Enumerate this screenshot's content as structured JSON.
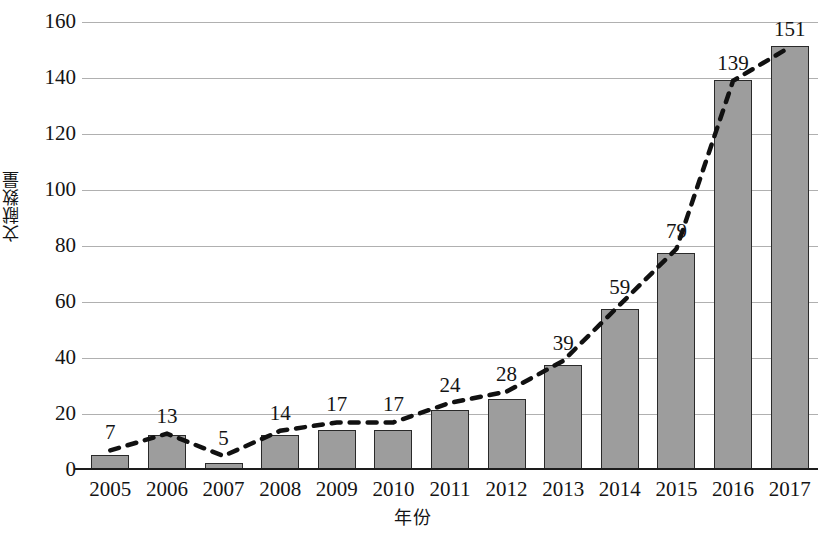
{
  "chart_data": {
    "type": "bar",
    "title": "",
    "xlabel": "年份",
    "ylabel": "文献数量",
    "categories": [
      "2005",
      "2006",
      "2007",
      "2008",
      "2009",
      "2010",
      "2011",
      "2012",
      "2013",
      "2014",
      "2015",
      "2016",
      "2017"
    ],
    "values": [
      5,
      12,
      2,
      12,
      14,
      14,
      21,
      25,
      37,
      57,
      77,
      139,
      151
    ],
    "data_labels": [
      "7",
      "13",
      "5",
      "14",
      "17",
      "17",
      "24",
      "28",
      "39",
      "59",
      "79",
      "139",
      "151"
    ],
    "series": [
      {
        "name": "文献数量",
        "type": "bar",
        "values": [
          5,
          12,
          2,
          12,
          14,
          14,
          21,
          25,
          37,
          57,
          77,
          139,
          151
        ]
      },
      {
        "name": "趋势线",
        "type": "line",
        "style": "dashed",
        "values": [
          7,
          13,
          5,
          14,
          17,
          17,
          24,
          28,
          39,
          59,
          79,
          139,
          151
        ]
      }
    ],
    "ylim": [
      0,
      160
    ],
    "yticks": [
      "0",
      "20",
      "40",
      "60",
      "80",
      "100",
      "120",
      "140",
      "160"
    ],
    "ytick_values": [
      0,
      20,
      40,
      60,
      80,
      100,
      120,
      140,
      160
    ],
    "grid": true,
    "legend": "none",
    "bar_color": "#9d9d9d",
    "bar_edge_color": "#2a2a2a",
    "line_color": "#111111",
    "gridline_color": "#b0b0b0"
  }
}
